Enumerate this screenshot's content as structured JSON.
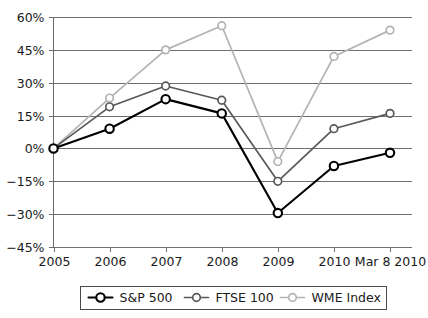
{
  "chart_data": {
    "type": "line",
    "title": "",
    "subtitle": "",
    "xlabel": "",
    "ylabel": "",
    "categories": [
      "2005",
      "2006",
      "2007",
      "2008",
      "2009",
      "2010",
      "Mar 8 2010"
    ],
    "series": [
      {
        "name": "S&P 500",
        "color": "#000000",
        "marker": "open-circle",
        "values": [
          0,
          9,
          22.5,
          16,
          -29.5,
          -8,
          -2
        ]
      },
      {
        "name": "FTSE 100",
        "color": "#595959",
        "marker": "open-circle",
        "values": [
          0,
          19,
          28.5,
          22,
          -15,
          9,
          16
        ]
      },
      {
        "name": "WME Index",
        "color": "#b3b3b3",
        "marker": "open-circle",
        "values": [
          0,
          23,
          45,
          56,
          -6,
          42,
          54
        ]
      }
    ],
    "ylim": [
      -45,
      60
    ],
    "yticks": [
      60,
      45,
      30,
      15,
      0,
      -15,
      -30,
      -45
    ],
    "ytick_labels": [
      "60%",
      "45%",
      "30%",
      "15%",
      "0%",
      "−15%",
      "−30%",
      "−45%"
    ],
    "xtick_labels": [
      "2005",
      "2006",
      "2007",
      "2008",
      "2009",
      "2010",
      "Mar 8 2010"
    ],
    "grid": true,
    "legend_position": "bottom",
    "legend_entries": [
      "S&P 500",
      "FTSE 100",
      "WME Index"
    ]
  },
  "colors": {
    "sp500": "#000000",
    "ftse100": "#595959",
    "wme": "#b3b3b3",
    "grid": "#6e6e6e",
    "text": "#1a1a1a",
    "background": "#ffffff"
  }
}
